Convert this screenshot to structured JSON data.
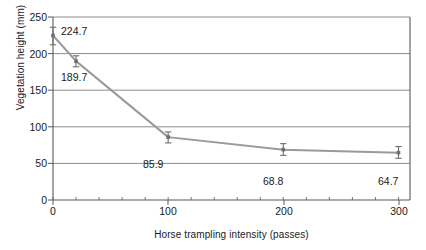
{
  "chart_data": {
    "type": "line",
    "title": "",
    "xlabel": "Horse trampling intensity (passes)",
    "ylabel": "Vegetation height (mm)",
    "x": [
      0,
      20,
      100,
      200,
      300
    ],
    "values": [
      224.7,
      189.7,
      85.9,
      68.8,
      64.7
    ],
    "error_bars": [
      {
        "x": 0,
        "y": 224.7,
        "low": 212.0,
        "high": 236.0
      },
      {
        "x": 20,
        "y": 189.7,
        "low": 182.0,
        "high": 197.0
      },
      {
        "x": 100,
        "y": 85.9,
        "low": 78.0,
        "high": 93.0
      },
      {
        "x": 200,
        "y": 68.8,
        "low": 61.0,
        "high": 77.0
      },
      {
        "x": 300,
        "y": 64.7,
        "low": 57.0,
        "high": 73.0
      }
    ],
    "point_labels": [
      "224.7",
      "189.7",
      "85.9",
      "68.8",
      "64.7"
    ],
    "xlim": [
      0,
      310
    ],
    "ylim": [
      0,
      250
    ],
    "yticks": [
      0,
      50,
      100,
      150,
      200,
      250
    ],
    "ytick_labels": [
      "0",
      "50",
      "100",
      "150",
      "200",
      "250"
    ],
    "xticks": [
      0,
      100,
      200,
      300
    ],
    "xtick_labels": [
      "0",
      "100",
      "200",
      "300"
    ],
    "x_minor_tick_step": 20,
    "grid": "horizontal",
    "legend": "none",
    "series_name": "Vegetation height",
    "colors": {
      "line": "#9a9a9a",
      "marker": "#6e6e6e",
      "grid": "#8c8c8c",
      "axis": "#595959",
      "text": "#1a1a1a",
      "background": "#ffffff"
    }
  }
}
